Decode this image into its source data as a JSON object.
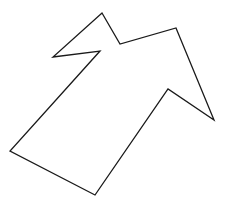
{
  "figure": {
    "width": 229,
    "height": 206,
    "background": "#ffffff",
    "shape": {
      "type": "polygon",
      "description": "irregular arrow-like polygon outline pointing up-right",
      "stroke": "#1a1a1a",
      "stroke_width": 1.3,
      "fill": "none",
      "points": [
        [
          102,
          13
        ],
        [
          120,
          44
        ],
        [
          176,
          28
        ],
        [
          214,
          120
        ],
        [
          168,
          89
        ],
        [
          95,
          195
        ],
        [
          10,
          151
        ],
        [
          100,
          51
        ],
        [
          53,
          57
        ]
      ]
    }
  }
}
